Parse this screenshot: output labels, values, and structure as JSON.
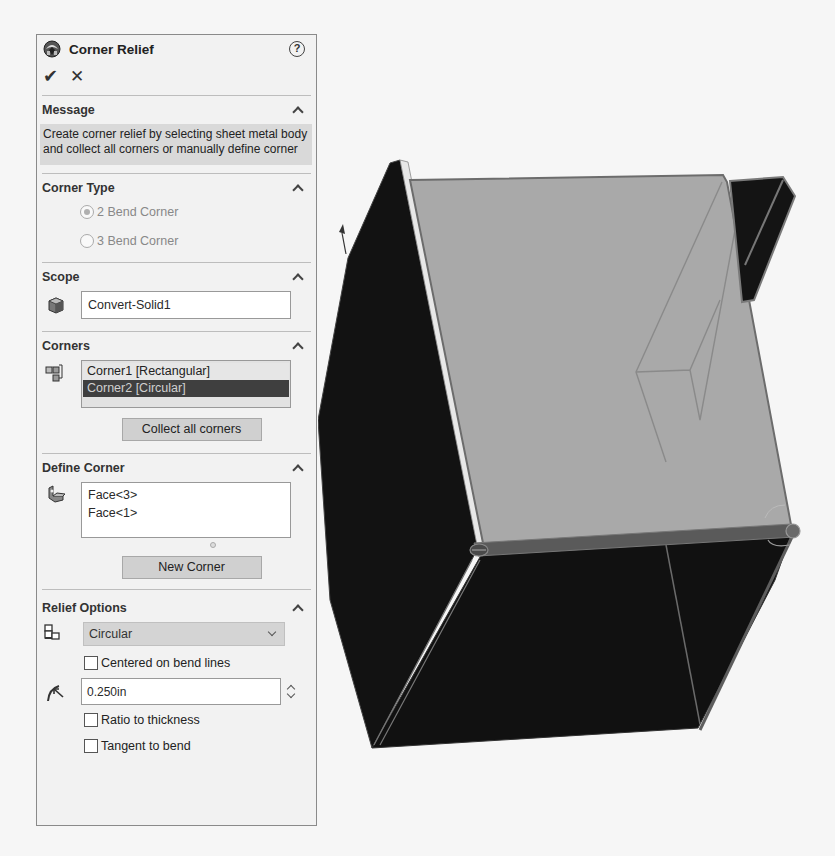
{
  "panel": {
    "title": "Corner Relief",
    "help_icon": "?",
    "ok_icon": "✔",
    "cancel_icon": "✕"
  },
  "message": {
    "title": "Message",
    "text": "Create corner relief by selecting sheet metal body and collect all corners or manually define corner"
  },
  "corner_type": {
    "title": "Corner Type",
    "options": [
      {
        "label": "2 Bend Corner",
        "checked": true,
        "enabled": false
      },
      {
        "label": "3 Bend Corner",
        "checked": false,
        "enabled": false
      }
    ]
  },
  "scope": {
    "title": "Scope",
    "body_value": "Convert-Solid1"
  },
  "corners": {
    "title": "Corners",
    "items": [
      {
        "label": "Corner1 [Rectangular]",
        "selected": false
      },
      {
        "label": "Corner2 [Circular]",
        "selected": true
      }
    ],
    "collect_button": "Collect all corners"
  },
  "define_corner": {
    "title": "Define Corner",
    "faces": [
      "Face<3>",
      "Face<1>"
    ],
    "new_corner_button": "New Corner"
  },
  "relief_options": {
    "title": "Relief Options",
    "relief_type": "Circular",
    "centered_on_bend_lines": {
      "label": "Centered on bend lines",
      "checked": false
    },
    "radius_value": "0.250in",
    "ratio_to_thickness": {
      "label": "Ratio to thickness",
      "checked": false
    },
    "tangent_to_bend": {
      "label": "Tangent to bend",
      "checked": false
    }
  },
  "viewport": {
    "model": "sheet-metal-box",
    "colors": {
      "background": "#f6f6f6",
      "dark_face": "#111111",
      "top_face": "#a8a8a8",
      "edge": "#6a6a6a"
    }
  }
}
